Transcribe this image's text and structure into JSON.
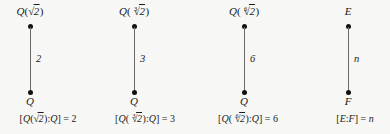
{
  "figure": {
    "kind": "field-extension-lattice-diagrams",
    "count": 4,
    "diagrams": [
      {
        "id": "sqrt2",
        "top_label": {
          "field": "Q",
          "radical_index": "",
          "radicand": "2"
        },
        "bottom_label": "Q",
        "edge_degree": "2",
        "caption": {
          "field": "Q",
          "radical_index": "",
          "radicand": "2",
          "base": "Q",
          "degree": "2"
        }
      },
      {
        "id": "cbrt2",
        "top_label": {
          "field": "Q",
          "radical_index": "3",
          "radicand": "2"
        },
        "bottom_label": "Q",
        "edge_degree": "3",
        "caption": {
          "field": "Q",
          "radical_index": "3",
          "radicand": "2",
          "base": "Q",
          "degree": "3"
        }
      },
      {
        "id": "sixthroot2",
        "top_label": {
          "field": "Q",
          "radical_index": "6",
          "radicand": "2"
        },
        "bottom_label": "Q",
        "edge_degree": "6",
        "caption": {
          "field": "Q",
          "radical_index": "6",
          "radicand": "2",
          "base": "Q",
          "degree": "6"
        }
      },
      {
        "id": "generic",
        "top_label": {
          "field": "E",
          "radical_index": "",
          "radicand": ""
        },
        "bottom_label": "F",
        "edge_degree": "n",
        "caption": {
          "field": "E",
          "radical_index": "",
          "radicand": "",
          "base": "F",
          "degree": "n"
        }
      }
    ],
    "symbols": {
      "radical_sign": "√",
      "bracket_open": "[",
      "bracket_close": "]",
      "colon": ":",
      "equals": "=",
      "paren_open": "(",
      "paren_close": ")"
    },
    "colors": {
      "background": "#f7f7f5",
      "text": "#1a1a1a",
      "edge_line": "#6b6b6b",
      "node_fill": "#111111"
    }
  }
}
